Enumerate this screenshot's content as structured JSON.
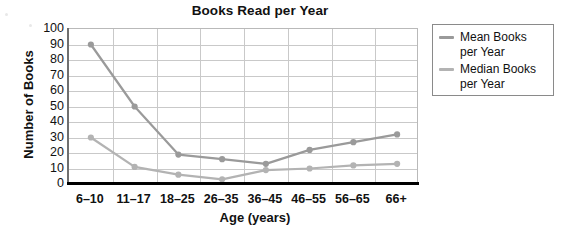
{
  "chart_data": {
    "type": "line",
    "title": "Books Read per Year",
    "xlabel": "Age (years)",
    "ylabel": "Number of Books",
    "categories": [
      "6–10",
      "11–17",
      "18–25",
      "26–35",
      "36–45",
      "46–55",
      "56–65",
      "66+"
    ],
    "ylim": [
      0,
      100
    ],
    "yticks": [
      100,
      90,
      80,
      70,
      60,
      50,
      40,
      30,
      20,
      10,
      0
    ],
    "grid": true,
    "legend_position": "right",
    "series": [
      {
        "name": "Mean Books per Year",
        "color": "#9a9a9a",
        "values": [
          90,
          50,
          19,
          16,
          13,
          22,
          27,
          32
        ]
      },
      {
        "name": "Median Books per Year",
        "color": "#b3b3b3",
        "values": [
          30,
          11,
          6,
          3,
          9,
          10,
          12,
          13
        ]
      }
    ]
  },
  "legend": {
    "entries": [
      {
        "label": "Mean Books per Year"
      },
      {
        "label": "Median Books per Year"
      }
    ]
  }
}
